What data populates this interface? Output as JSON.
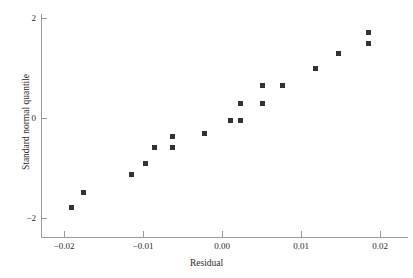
{
  "chart_data": {
    "type": "scatter",
    "title": "",
    "xlabel": "Residual",
    "ylabel": "Standard normal quantile",
    "xlim": [
      -0.0229,
      0.0235
    ],
    "ylim": [
      -2.46,
      2.08
    ],
    "grid": false,
    "legend": null,
    "xticks": [
      -0.02,
      -0.01,
      0.0,
      0.01,
      0.02
    ],
    "xtick_labels": [
      "−0.02",
      "−0.01",
      "0.00",
      "0.01",
      "0.02"
    ],
    "yticks": [
      2,
      0,
      -2
    ],
    "ytick_labels": [
      "2",
      "0",
      "−2"
    ],
    "marker": "square",
    "marker_color": "#333333",
    "axis_color": "#9a9a9a",
    "points": [
      {
        "x": -0.019,
        "y": -1.78
      },
      {
        "x": -0.0175,
        "y": -1.48
      },
      {
        "x": -0.0115,
        "y": -1.12
      },
      {
        "x": -0.0097,
        "y": -0.9
      },
      {
        "x": -0.0086,
        "y": -0.58
      },
      {
        "x": -0.0063,
        "y": -0.58
      },
      {
        "x": -0.0063,
        "y": -0.36
      },
      {
        "x": -0.0022,
        "y": -0.3
      },
      {
        "x": 0.0011,
        "y": -0.04
      },
      {
        "x": 0.0024,
        "y": -0.04
      },
      {
        "x": 0.0023,
        "y": 0.3
      },
      {
        "x": 0.0051,
        "y": 0.3
      },
      {
        "x": 0.0051,
        "y": 0.66
      },
      {
        "x": 0.0077,
        "y": 0.66
      },
      {
        "x": 0.0118,
        "y": 1.0
      },
      {
        "x": 0.0147,
        "y": 1.3
      },
      {
        "x": 0.0186,
        "y": 1.72
      },
      {
        "x": 0.0186,
        "y": 1.5
      }
    ]
  }
}
